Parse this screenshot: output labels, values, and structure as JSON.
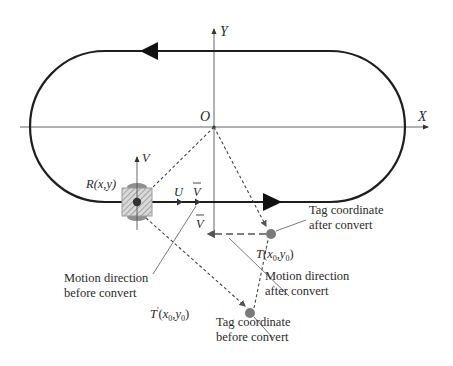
{
  "axes": {
    "x_label": "X",
    "y_label": "Y",
    "origin_label": "O"
  },
  "robot": {
    "label_prefix": "R",
    "label_args": "(x,y)",
    "local_v_axis_label": "V",
    "local_u_axis_label": "U",
    "velocity_label": "V"
  },
  "tag_after": {
    "label_prefix": "T",
    "label_x": "x",
    "label_y": "y",
    "subscript": "0",
    "velocity_label": "V"
  },
  "tag_before": {
    "label_prefix": "T",
    "prime": "'",
    "label_x": "x",
    "label_y": "y",
    "subscript": "0"
  },
  "annotations": {
    "tag_after_line1": "Tag coordinate",
    "tag_after_line2": "after convert",
    "motion_before_line1": "Motion direction",
    "motion_before_line2": "before convert",
    "motion_after_line1": "Motion direction",
    "motion_after_line2": "after convert",
    "tag_before_line1": "Tag coordinate",
    "tag_before_line2": "before convert"
  },
  "colors": {
    "track": "#1e1e1e",
    "axis": "#555555",
    "dashed": "#444444",
    "point": "#7a7a7a",
    "robot_box": "#bdbdbd",
    "leader": "#6a6a6a"
  }
}
